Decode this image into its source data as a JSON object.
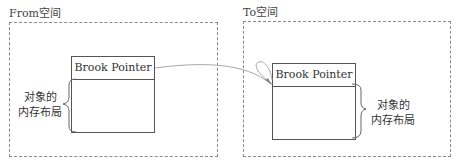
{
  "from_space": {
    "title": "From空间",
    "object": {
      "header": "Brook Pointer",
      "layout_label_line1": "对象的",
      "layout_label_line2": "内存布局"
    }
  },
  "to_space": {
    "title": "To空间",
    "object": {
      "header": "Brook Pointer",
      "layout_label_line1": "对象的",
      "layout_label_line2": "内存布局"
    }
  },
  "colors": {
    "dashed_border": "#8a8a8a",
    "box_border": "#555555",
    "arrow": "#a0a0a0"
  }
}
